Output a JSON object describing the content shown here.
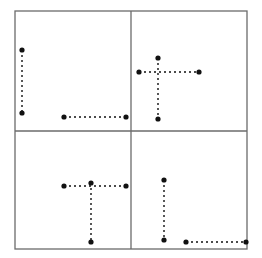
{
  "figure": {
    "title": "",
    "canvas": {
      "width": 262,
      "height": 258,
      "background": "#ffffff"
    },
    "frame": {
      "label": "quadrant-frame",
      "x": 15,
      "y": 11,
      "width": 232,
      "height": 238,
      "stroke": "#6b6b6b",
      "stroke_width": 1.3
    },
    "dividers": [
      {
        "label": "vertical-divider",
        "orientation": "vertical",
        "x1": 131,
        "y1": 11,
        "x2": 131,
        "y2": 249,
        "stroke": "#6b6b6b",
        "stroke_width": 1.3
      },
      {
        "label": "horizontal-divider",
        "orientation": "horizontal",
        "x1": 15,
        "y1": 131,
        "x2": 247,
        "y2": 131,
        "stroke": "#6b6b6b",
        "stroke_width": 1.3
      }
    ],
    "style": {
      "segment_stroke": "#111111",
      "segment_stroke_width": 1.4,
      "segment_dash": "2,3",
      "endpoint_fill": "#111111",
      "endpoint_radius": 2.6
    },
    "quadrants": [
      {
        "name": "top-left",
        "segments": [
          {
            "label": "tl-vertical-segment",
            "orientation": "vertical",
            "x1": 22,
            "y1": 50,
            "x2": 22,
            "y2": 113,
            "endpoints": [
              {
                "x": 22,
                "y": 50
              },
              {
                "x": 22,
                "y": 113
              }
            ]
          },
          {
            "label": "tl-horizontal-segment",
            "orientation": "horizontal",
            "x1": 64,
            "y1": 117,
            "x2": 126,
            "y2": 117,
            "endpoints": [
              {
                "x": 64,
                "y": 117
              },
              {
                "x": 126,
                "y": 117
              }
            ]
          }
        ]
      },
      {
        "name": "top-right",
        "segments": [
          {
            "label": "tr-vertical-segment",
            "orientation": "vertical",
            "x1": 158,
            "y1": 58,
            "x2": 158,
            "y2": 119,
            "endpoints": [
              {
                "x": 158,
                "y": 58
              },
              {
                "x": 158,
                "y": 119
              }
            ]
          },
          {
            "label": "tr-horizontal-segment",
            "orientation": "horizontal",
            "x1": 139,
            "y1": 72,
            "x2": 199,
            "y2": 72,
            "endpoints": [
              {
                "x": 139,
                "y": 72
              },
              {
                "x": 199,
                "y": 72
              }
            ]
          }
        ]
      },
      {
        "name": "bottom-left",
        "segments": [
          {
            "label": "bl-horizontal-segment",
            "orientation": "horizontal",
            "x1": 64,
            "y1": 186,
            "x2": 126,
            "y2": 186,
            "endpoints": [
              {
                "x": 64,
                "y": 186
              },
              {
                "x": 126,
                "y": 186
              }
            ]
          },
          {
            "label": "bl-vertical-segment",
            "orientation": "vertical",
            "x1": 91,
            "y1": 183,
            "x2": 91,
            "y2": 242,
            "endpoints": [
              {
                "x": 91,
                "y": 183
              },
              {
                "x": 91,
                "y": 242
              }
            ]
          }
        ]
      },
      {
        "name": "bottom-right",
        "segments": [
          {
            "label": "br-vertical-segment",
            "orientation": "vertical",
            "x1": 164,
            "y1": 180,
            "x2": 164,
            "y2": 240,
            "endpoints": [
              {
                "x": 164,
                "y": 180
              },
              {
                "x": 164,
                "y": 240
              }
            ]
          },
          {
            "label": "br-horizontal-segment",
            "orientation": "horizontal",
            "x1": 186,
            "y1": 242,
            "x2": 246,
            "y2": 242,
            "endpoints": [
              {
                "x": 186,
                "y": 242
              },
              {
                "x": 246,
                "y": 242
              }
            ]
          }
        ]
      }
    ]
  }
}
